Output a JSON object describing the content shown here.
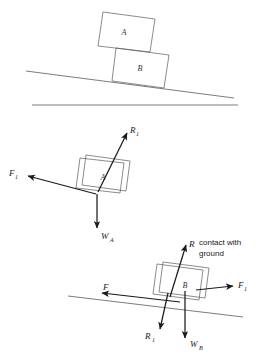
{
  "figure": {
    "title_visible": false,
    "background_color": "#ffffff",
    "line_color": "#444444",
    "arrow_color": "#1a1a1a",
    "box_color": "#5a5a5a"
  },
  "panels": [
    {
      "id": "situation",
      "name": "situation-diagram",
      "blocks": [
        {
          "id": "block-a",
          "label": "A"
        },
        {
          "id": "block-b",
          "label": "B"
        }
      ],
      "lines": [
        {
          "id": "incline",
          "name": "incline-surface"
        },
        {
          "id": "ground",
          "name": "ground-surface"
        }
      ]
    },
    {
      "id": "fbd-a",
      "name": "free-body-diagram-block-a",
      "block_label": "A",
      "forces": [
        {
          "id": "r1",
          "symbol": "R",
          "subscript": "1",
          "direction": "up-right",
          "name": "normal-reaction-r1"
        },
        {
          "id": "f1",
          "symbol": "F",
          "subscript": "1",
          "direction": "left-down",
          "name": "friction-force-f1"
        },
        {
          "id": "wa",
          "symbol": "W",
          "subscript": "A",
          "direction": "down",
          "name": "weight-wa"
        }
      ]
    },
    {
      "id": "fbd-b",
      "name": "free-body-diagram-block-b",
      "block_label": "B",
      "annotation": {
        "line1": "contact with",
        "line2": "ground"
      },
      "forces": [
        {
          "id": "r",
          "symbol": "R",
          "subscript": "",
          "direction": "up-right",
          "name": "normal-reaction-r"
        },
        {
          "id": "f1b",
          "symbol": "F",
          "subscript": "1",
          "direction": "right-up",
          "name": "friction-force-f1"
        },
        {
          "id": "fb",
          "symbol": "F",
          "subscript": "",
          "direction": "left-down",
          "name": "friction-force-f"
        },
        {
          "id": "r1b",
          "symbol": "R",
          "subscript": "1",
          "direction": "down-left",
          "name": "reaction-r1"
        },
        {
          "id": "wb",
          "symbol": "W",
          "subscript": "B",
          "direction": "down",
          "name": "weight-wb"
        }
      ]
    }
  ]
}
